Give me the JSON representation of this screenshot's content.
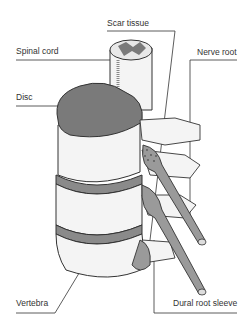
{
  "diagram": {
    "labels": {
      "scar_tissue": "Scar tissue",
      "spinal_cord": "Spinal cord",
      "nerve_root": "Nerve root",
      "disc": "Disc",
      "vertebra": "Vertebra",
      "dural_root_sleeve": "Dural root sleeve"
    },
    "colors": {
      "ink": "#333333",
      "fill_dark": "#7a7a7a",
      "fill_mid": "#9a9a9a",
      "bone": "#f4f4f4"
    }
  }
}
